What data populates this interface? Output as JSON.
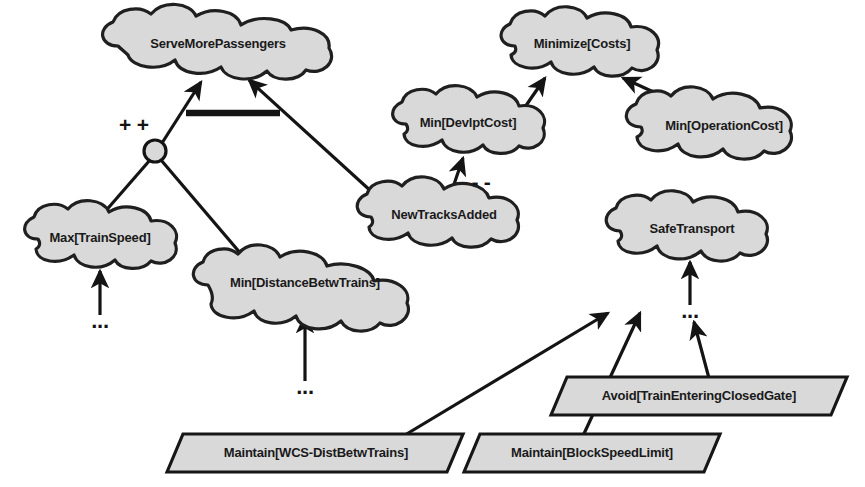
{
  "diagram": {
    "background_color": "#ffffff",
    "node_fill_color": "#d9d9d9",
    "node_stroke_color": "#1f1f1f",
    "text_color": "#1a1a1a"
  },
  "goals": [
    {
      "id": "serve_more_passengers",
      "label": "ServeMorePassengers",
      "shape": "cloud",
      "cx": 218,
      "cy": 45,
      "rx": 118,
      "ry": 27,
      "font_size": 13
    },
    {
      "id": "minimize_costs",
      "label": "Minimize[Costs]",
      "shape": "cloud",
      "cx": 580,
      "cy": 45,
      "rx": 82,
      "ry": 25,
      "font_size": 13
    },
    {
      "id": "min_devlpt_cost",
      "label": "Min[DevlptCost]",
      "shape": "cloud",
      "cx": 468,
      "cy": 124,
      "rx": 79,
      "ry": 25,
      "font_size": 13
    },
    {
      "id": "min_operation_cost",
      "label": "Min[OperationCost]",
      "shape": "cloud",
      "cx": 724,
      "cy": 127,
      "rx": 95,
      "ry": 26,
      "font_size": 13
    },
    {
      "id": "max_train_speed",
      "label": "Max[TrainSpeed]",
      "shape": "cloud",
      "cx": 100,
      "cy": 239,
      "rx": 82,
      "ry": 25,
      "font_size": 13
    },
    {
      "id": "min_distance_betw_trains",
      "label": "Min[DistanceBetwTrains]",
      "shape": "cloud",
      "cx": 305,
      "cy": 284,
      "rx": 114,
      "ry": 26,
      "font_size": 13
    },
    {
      "id": "new_tracks_added",
      "label": "NewTracksAdded",
      "shape": "cloud",
      "cx": 444,
      "cy": 216,
      "rx": 90,
      "ry": 25,
      "font_size": 13
    },
    {
      "id": "safe_transport",
      "label": "SafeTransport",
      "shape": "cloud",
      "cx": 692,
      "cy": 230,
      "rx": 84,
      "ry": 25,
      "font_size": 13
    }
  ],
  "operations": [
    {
      "id": "maintain_wcs_dist_betw_trains",
      "label": "Maintain[WCS-DistBetwTrains]",
      "shape": "parallelogram",
      "cx": 315,
      "cy": 453,
      "half_width": 148,
      "half_height": 19,
      "skew": 16,
      "font_size": 13
    },
    {
      "id": "maintain_block_speed_limit",
      "label": "Maintain[BlockSpeedLimit]",
      "shape": "parallelogram",
      "cx": 592,
      "cy": 453,
      "half_width": 128,
      "half_height": 19,
      "skew": 16,
      "font_size": 13
    },
    {
      "id": "avoid_train_entering_closed_gate",
      "label": "Avoid[TrainEnteringClosedGate]",
      "shape": "parallelogram",
      "cx": 699,
      "cy": 396,
      "half_width": 148,
      "half_height": 19,
      "skew": 16,
      "font_size": 13
    }
  ],
  "contribution_labels": [
    {
      "id": "positive_contribution",
      "text": "+ +",
      "x": 134,
      "y": 126,
      "sign": "positive"
    },
    {
      "id": "negative_contribution",
      "text": "- -",
      "x": 478,
      "y": 183,
      "sign": "negative"
    }
  ],
  "ellipses": [
    {
      "id": "ellipsis-under-max-train-speed",
      "text": "...",
      "cx": 100,
      "cy": 322
    },
    {
      "id": "ellipsis-under-min-distance",
      "text": "...",
      "cx": 305,
      "cy": 388
    },
    {
      "id": "ellipsis-under-safe-transport",
      "text": "...",
      "cx": 690,
      "cy": 312
    }
  ],
  "junction": {
    "id": "and-refinement-junction",
    "cx": 155,
    "cy": 151,
    "r": 11
  },
  "refinement_bar": {
    "id": "and-refinement-bar",
    "x1": 190,
    "y1": 112,
    "x2": 278,
    "y2": 112
  },
  "edges": [
    {
      "id": "junction-to-serve",
      "from": "and-refinement-junction",
      "to": "serve_more_passengers",
      "kind": "refinement",
      "arrow": true
    },
    {
      "id": "new-tracks-to-serve",
      "from": "new_tracks_added",
      "to": "serve_more_passengers",
      "kind": "refinement",
      "arrow": true
    },
    {
      "id": "max-train-speed-to-junction",
      "from": "max_train_speed",
      "to": "and-refinement-junction",
      "kind": "link",
      "arrow": false
    },
    {
      "id": "min-distance-to-junction",
      "from": "min_distance_betw_trains",
      "to": "and-refinement-junction",
      "kind": "link",
      "arrow": false
    },
    {
      "id": "min-devlpt-to-minimize-costs",
      "from": "min_devlpt_cost",
      "to": "minimize_costs",
      "kind": "refinement",
      "arrow": true
    },
    {
      "id": "min-operation-to-minimize-costs",
      "from": "min_operation_cost",
      "to": "minimize_costs",
      "kind": "refinement",
      "arrow": true
    },
    {
      "id": "new-tracks-to-min-devlpt",
      "from": "new_tracks_added",
      "to": "min_devlpt_cost",
      "kind": "contribution-negative",
      "arrow": true
    },
    {
      "id": "ellipsis-to-max-train-speed",
      "from": "ellipsis-under-max-train-speed",
      "to": "max_train_speed",
      "kind": "refinement",
      "arrow": true
    },
    {
      "id": "ellipsis-to-min-distance",
      "from": "ellipsis-under-min-distance",
      "to": "min_distance_betw_trains",
      "kind": "refinement",
      "arrow": true
    },
    {
      "id": "ellipsis-to-safe-transport",
      "from": "ellipsis-under-safe-transport",
      "to": "safe_transport",
      "kind": "refinement",
      "arrow": true
    },
    {
      "id": "avoid-gate-to-ellipsis",
      "from": "avoid_train_entering_closed_gate",
      "to": "ellipsis-under-safe-transport",
      "kind": "operationalization",
      "arrow": true
    },
    {
      "id": "maintain-wcs-to-safe-transport",
      "from": "maintain_wcs_dist_betw_trains",
      "to": "safe_transport",
      "kind": "operationalization",
      "arrow": true
    },
    {
      "id": "maintain-block-speed-to-safe-transport",
      "from": "maintain_block_speed_limit",
      "to": "safe_transport",
      "kind": "operationalization",
      "arrow": true
    }
  ]
}
